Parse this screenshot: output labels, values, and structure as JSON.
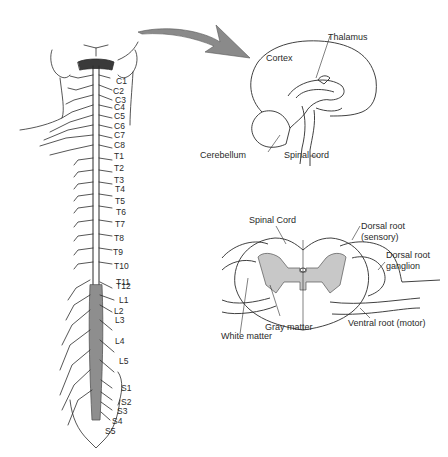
{
  "figure": {
    "panels": {
      "spine": {
        "segment_labels": {
          "cervical": [
            "C1",
            "C2",
            "C3",
            "C4",
            "C5",
            "C6",
            "C7",
            "C8"
          ],
          "thoracic": [
            "T1",
            "T2",
            "T3",
            "T4",
            "T5",
            "T6",
            "T7",
            "T8",
            "T9",
            "T10",
            "T11",
            "T12"
          ],
          "lumbar": [
            "L1",
            "L2",
            "L3",
            "L4",
            "L5"
          ],
          "sacral": [
            "S1",
            "S2",
            "S3",
            "S4",
            "S5"
          ]
        }
      },
      "brain": {
        "labels": {
          "thalamus": "Thalamus",
          "cortex": "Cortex",
          "cerebellum": "Cerebellum",
          "spinal_cord": "Spinal cord"
        }
      },
      "cross_section": {
        "labels": {
          "spinal_cord": "Spinal Cord",
          "dorsal_root": "Dorsal root",
          "dorsal_root_sub": "(sensory)",
          "dorsal_root_ganglion_1": "Dorsal root",
          "dorsal_root_ganglion_2": "ganglion",
          "gray_matter": "Gray matter",
          "white_matter": "White matter",
          "ventral_root": "Ventral root (motor)"
        }
      }
    },
    "colors": {
      "line": "#2b2b2b",
      "gray_matter": "#c8c8c8",
      "arrow": "#8a8a8a",
      "background": "#ffffff"
    }
  }
}
